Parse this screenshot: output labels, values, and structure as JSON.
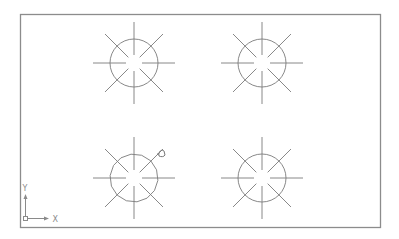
{
  "viewport": {
    "background": "#ffffff",
    "frame": {
      "x": 20,
      "y": 14,
      "width": 361,
      "height": 214,
      "color": "#8c8c8c"
    }
  },
  "drawing": {
    "line_color": "#7a7a7a",
    "symbols": [
      {
        "id": "symbol-top-left",
        "cx": 134,
        "cy": 63,
        "r": 24,
        "ray_inner": 8,
        "ray_outer": 41,
        "faceted": false
      },
      {
        "id": "symbol-top-right",
        "cx": 262,
        "cy": 63,
        "r": 24,
        "ray_inner": 8,
        "ray_outer": 41,
        "faceted": false
      },
      {
        "id": "symbol-bottom-left",
        "cx": 134,
        "cy": 178,
        "r": 24,
        "ray_inner": 8,
        "ray_outer": 41,
        "faceted": true
      },
      {
        "id": "symbol-bottom-right",
        "cx": 262,
        "cy": 178,
        "r": 24,
        "ray_inner": 8,
        "ray_outer": 41,
        "faceted": false
      }
    ]
  },
  "cursor": {
    "icon": "pick-cursor-icon",
    "x": 161,
    "y": 153
  },
  "ucs_icon": {
    "origin_x": 25,
    "origin_y": 219,
    "x_label": "X",
    "y_label": "Y"
  }
}
